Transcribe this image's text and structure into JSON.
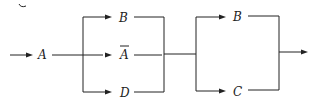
{
  "diagram": {
    "type": "reliability-block-diagram",
    "nodes": [
      {
        "id": "A",
        "label": "A",
        "overbar": false
      },
      {
        "id": "B1",
        "label": "B",
        "overbar": false
      },
      {
        "id": "Abar",
        "label": "A",
        "overbar": true
      },
      {
        "id": "D",
        "label": "D",
        "overbar": false
      },
      {
        "id": "B2",
        "label": "B",
        "overbar": false
      },
      {
        "id": "C",
        "label": "C",
        "overbar": false
      }
    ],
    "groups": [
      {
        "name": "parallel-1",
        "members": [
          "B1",
          "Abar",
          "D"
        ]
      },
      {
        "name": "parallel-2",
        "members": [
          "B2",
          "C"
        ]
      }
    ],
    "edges": [
      [
        "input",
        "A"
      ],
      [
        "A",
        "parallel-1"
      ],
      [
        "parallel-1",
        "parallel-2"
      ],
      [
        "parallel-2",
        "output"
      ]
    ]
  }
}
